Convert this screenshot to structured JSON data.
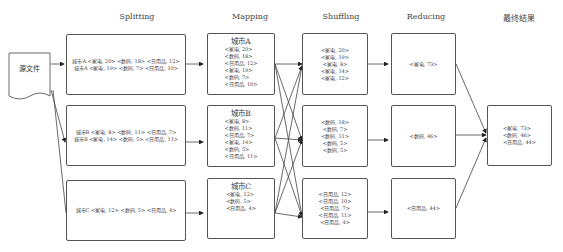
{
  "headers": {
    "splitting": "Splitting",
    "mapping": "Mapping",
    "shuffling": "Shuffling",
    "reducing": "Reducing",
    "final": "最终结果"
  },
  "source": {
    "label": "源文件"
  },
  "splitting": [
    {
      "lines": [
        "城市A <家电, 20> <数码, 18> <日用品, 12>",
        "城市A <家电, 19> <数码, 7> <日用品, 10>"
      ]
    },
    {
      "lines": [
        "城市B <家电, 8> <数码, 11> <日用品, 7>",
        "城市B <家电, 14> <数码, 5> <日用品, 11>"
      ]
    },
    {
      "lines": [
        "城市C <家电, 12> <数码, 5> <日用品, 4>"
      ]
    }
  ],
  "mapping": [
    {
      "city": "城市A",
      "items": [
        "<家电, 20>",
        "<数码, 18>",
        "<日用品, 12>",
        "<家电, 19>",
        "<数码, 7>",
        "<日用品, 10>"
      ]
    },
    {
      "city": "城市B",
      "items": [
        "<家电, 8>",
        "<数码, 11>",
        "<日用品, 7>",
        "<家电, 14>",
        "<数码, 5>",
        "<日用品, 11>"
      ]
    },
    {
      "city": "城市C",
      "items": [
        "<家电, 12>",
        "<数码, 5>",
        "<日用品, 4>"
      ]
    }
  ],
  "shuffling": [
    {
      "items": [
        "<家电, 20>",
        "<家电, 19>",
        "<家电, 8>",
        "<家电, 14>",
        "<家电, 12>"
      ]
    },
    {
      "items": [
        "<数码, 18>",
        "<数码, 7>",
        "<数码, 11>",
        "<数码, 5>",
        "<数码, 5>"
      ]
    },
    {
      "items": [
        "<日用品, 12>",
        "<日用品, 10>",
        "<日用品, 7>",
        "<日用品, 11>",
        "<日用品, 4>"
      ]
    }
  ],
  "reducing": [
    {
      "items": [
        "<家电, 73>"
      ]
    },
    {
      "items": [
        "<数码, 46>"
      ]
    },
    {
      "items": [
        "<日用品, 44>"
      ]
    }
  ],
  "final": {
    "items": [
      "<家电, 73>",
      "<数码, 46>",
      "<日用品, 44>"
    ]
  },
  "colors": {
    "line": "#444444",
    "border": "#555555",
    "background": "#ffffff"
  }
}
